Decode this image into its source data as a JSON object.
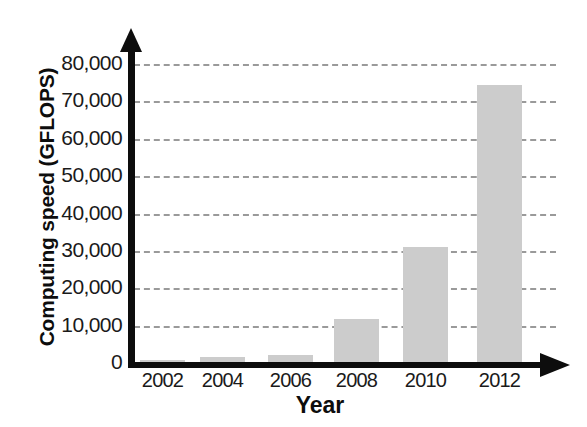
{
  "chart_data": {
    "type": "bar",
    "title": "",
    "xlabel": "Year",
    "ylabel": "Computing speed (GFLOPS)",
    "categories": [
      "2002",
      "2004",
      "2006",
      "2008",
      "2010",
      "2012"
    ],
    "values": [
      900,
      1600,
      2200,
      11800,
      31000,
      74400
    ],
    "ylim": [
      0,
      80000
    ],
    "ytick_labels": [
      "0",
      "10,000",
      "20,000",
      "30,000",
      "40,000",
      "50,000",
      "60,000",
      "70,000",
      "80,000"
    ],
    "ytick_values": [
      0,
      10000,
      20000,
      30000,
      40000,
      50000,
      60000,
      70000,
      80000
    ],
    "grid": true,
    "grid_style": "dashed-horizontal",
    "legend": "none",
    "bar_color": "#cccccc",
    "axis_color": "#0d0d0d",
    "grid_color": "#9a9a9a"
  }
}
